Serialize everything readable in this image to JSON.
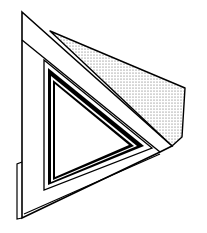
{
  "figure": {
    "title": "Triangular frame line illustration",
    "colors": {
      "background": "#ffffff",
      "ink": "#000000",
      "stipple": "#555555"
    },
    "shapes": {
      "outer_frame": "outer-triangle",
      "shaded_plane": "stippled-plane",
      "inner_frame": "inner-triangle-frame",
      "tab": "bottom-left-tab"
    }
  }
}
